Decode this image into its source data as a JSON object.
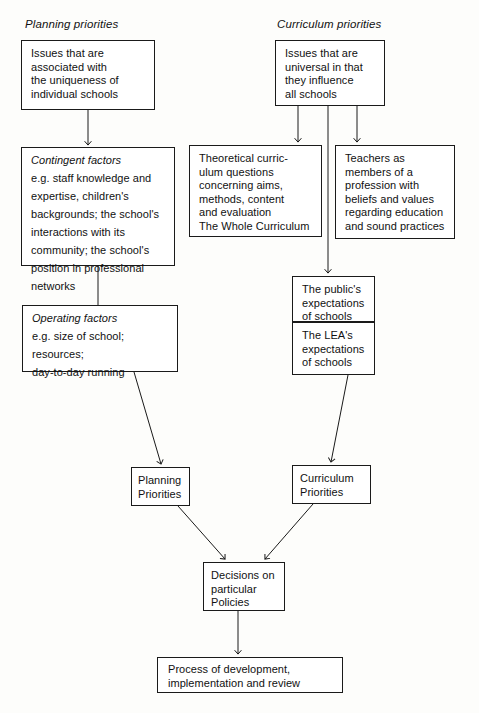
{
  "diagram": {
    "title_implied": "Planning and curriculum priorities flowchart",
    "headers": [
      {
        "name": "planning-priorities-header",
        "label": "Planning priorities"
      },
      {
        "name": "curriculum-priorities-header",
        "label": "Curriculum priorities"
      }
    ],
    "boxes": {
      "unique_issues": {
        "text": "Issues that are\nassociated with\nthe uniqueness of\nindividual schools"
      },
      "universal_issues": {
        "text": "Issues that are\nuniversal in that\nthey influence\nall schools"
      },
      "contingent_factors": {
        "title": "Contingent factors",
        "text": "e.g. staff knowledge and\nexpertise, children's\nbackgrounds; the school's\ninteractions with its\ncommunity; the school's\nposition in professional\nnetworks"
      },
      "theoretical_curriculum": {
        "text": "Theoretical curric-\nulum questions\nconcerning aims,\nmethods, content\nand evaluation\nThe Whole Curriculum"
      },
      "teachers_profession": {
        "text": "Teachers as\nmembers of a\nprofession with\nbeliefs and values\nregarding education\nand sound practices"
      },
      "operating_factors": {
        "title": "Operating factors",
        "text": "e.g. size of school;\n        resources;\n        day-to-day running"
      },
      "public_expectations": {
        "text": "The public's\nexpectations\nof schools"
      },
      "lea_expectations": {
        "text": "The LEA's\nexpectations\nof schools"
      },
      "planning_priorities": {
        "text": "Planning\nPriorities"
      },
      "curriculum_priorities": {
        "text": "Curriculum\nPriorities"
      },
      "decisions": {
        "text": "Decisions on\nparticular\nPolicies"
      },
      "process": {
        "text": "Process of development,\nimplementation and review"
      }
    },
    "colors": {
      "line": "#1a1a1a",
      "text": "#111111",
      "background": "#fdfdfb"
    }
  }
}
